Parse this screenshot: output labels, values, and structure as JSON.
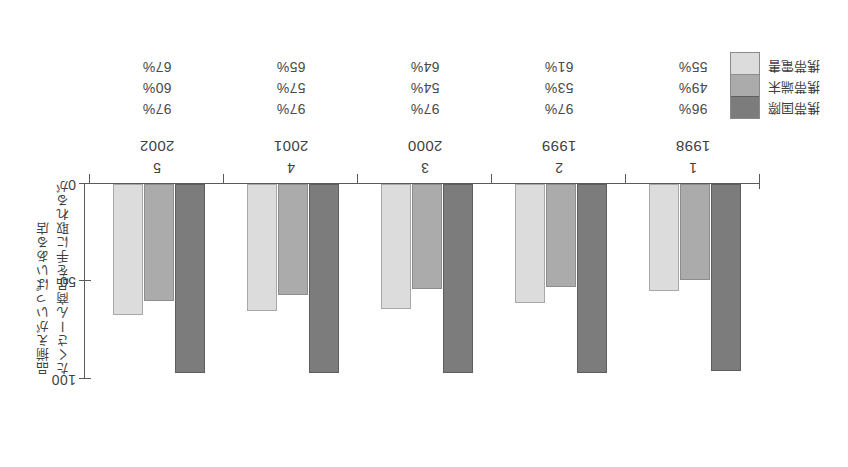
{
  "figure": {
    "orientation": "rotated-180",
    "axis_caption_lines": [
      "たくさーん商品を手に取れるが",
      "品揃えがいっぱいある店"
    ],
    "y_axis": {
      "ticks": [
        "0",
        "50",
        "100"
      ],
      "min": 0,
      "max": 100
    },
    "legend": {
      "items": [
        {
          "label": "携帯国際",
          "color": "#7c7c7c"
        },
        {
          "label": "携帯端末",
          "color": "#ababab"
        },
        {
          "label": "携帯電書",
          "color": "#dcdcdc"
        }
      ]
    }
  },
  "chart_data": {
    "type": "bar",
    "title": "",
    "xlabel": "",
    "ylabel": "たくさーん商品を手に取れるが",
    "ylim": [
      0,
      100
    ],
    "grid": false,
    "legend_position": "bottom-right",
    "categories": [
      "1998",
      "1999",
      "2000",
      "2001",
      "2002"
    ],
    "category_indices": [
      "1",
      "2",
      "3",
      "4",
      "5"
    ],
    "series": [
      {
        "name": "携帯国際",
        "color": "#7c7c7c",
        "values": [
          96,
          97,
          97,
          97,
          97
        ],
        "labels": [
          "96%",
          "97%",
          "97%",
          "97%",
          "97%"
        ]
      },
      {
        "name": "携帯端末",
        "color": "#ababab",
        "values": [
          49,
          53,
          54,
          57,
          60
        ],
        "labels": [
          "49%",
          "53%",
          "54%",
          "57%",
          "60%"
        ]
      },
      {
        "name": "携帯電書",
        "color": "#dcdcdc",
        "values": [
          55,
          61,
          64,
          65,
          67
        ],
        "labels": [
          "55%",
          "61%",
          "64%",
          "65%",
          "67%"
        ]
      }
    ]
  }
}
